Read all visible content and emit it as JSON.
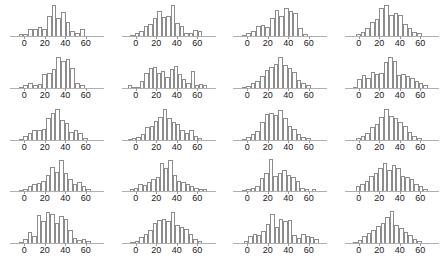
{
  "figure": {
    "title": "",
    "layout": {
      "rows": 5,
      "columns": 4,
      "panel_count": 20
    },
    "colors": {
      "background": "#ffffff",
      "bar_outline": "#8c8c8c",
      "bar_fill": "#ffffff",
      "axis_line": "#b0b0b0",
      "tick_label": "#1a1a1a"
    }
  },
  "axis": {
    "tick_labels": [
      "0",
      "20",
      "40",
      "60"
    ],
    "tick_values": [
      0,
      20,
      40,
      60
    ],
    "xlim": [
      -8,
      72
    ],
    "ylabel": "",
    "xlabel": ""
  },
  "chart_data": {
    "type": "bar",
    "title": "",
    "subtitle": "",
    "xlabel": "",
    "ylabel": "",
    "grid": false,
    "legend": "none",
    "layout": {
      "rows": 5,
      "columns": 4,
      "shared_x_axis": true
    },
    "xlim": [
      -8,
      72
    ],
    "ylim": [
      0,
      1
    ],
    "bin_width": 4,
    "bin_centers": [
      -6,
      -2,
      2,
      6,
      10,
      14,
      18,
      22,
      26,
      30,
      34,
      38,
      42,
      46,
      50,
      54,
      58,
      62,
      66,
      70
    ],
    "xtick_values": [
      0,
      20,
      40,
      60
    ],
    "xtick_labels": [
      "0",
      "20",
      "40",
      "60"
    ],
    "note": "Grid of 20 small-multiple histograms; values are relative bin counts (0-1 scale of panel height).",
    "panels": [
      {
        "index": 1,
        "row": 1,
        "col": 1,
        "categories": [
          -6,
          -2,
          2,
          6,
          10,
          14,
          18,
          22,
          26,
          30,
          34,
          38,
          42,
          46,
          50,
          54,
          58,
          62,
          66,
          70
        ],
        "values": [
          0,
          0.05,
          0.05,
          0.22,
          0.22,
          0.28,
          0.22,
          0.62,
          0.97,
          0.56,
          0.75,
          0.45,
          0.16,
          0.09,
          0.22,
          0,
          0,
          0,
          0,
          0
        ]
      },
      {
        "index": 2,
        "row": 1,
        "col": 2,
        "categories": [
          -6,
          -2,
          2,
          6,
          10,
          14,
          18,
          22,
          26,
          30,
          34,
          38,
          42,
          46,
          50,
          54,
          58,
          62,
          66,
          70
        ],
        "values": [
          0,
          0.03,
          0.09,
          0.16,
          0.31,
          0.38,
          0.56,
          0.78,
          0.59,
          0.62,
          0.97,
          0.41,
          0.31,
          0.09,
          0.09,
          0.19,
          0.16,
          0,
          0,
          0
        ]
      },
      {
        "index": 3,
        "row": 1,
        "col": 3,
        "categories": [
          -6,
          -2,
          2,
          6,
          10,
          14,
          18,
          22,
          26,
          30,
          34,
          38,
          42,
          46,
          50,
          54,
          58,
          62,
          66,
          70
        ],
        "values": [
          0,
          0.03,
          0.09,
          0.16,
          0.31,
          0.34,
          0.28,
          0.56,
          0.81,
          0.62,
          0.88,
          0.78,
          0.72,
          0.25,
          0.06,
          0,
          0,
          0,
          0,
          0
        ]
      },
      {
        "index": 4,
        "row": 1,
        "col": 4,
        "categories": [
          -6,
          -2,
          2,
          6,
          10,
          14,
          18,
          22,
          26,
          30,
          34,
          38,
          42,
          46,
          50,
          54,
          58,
          62,
          66,
          70
        ],
        "values": [
          0,
          0,
          0.06,
          0.12,
          0.25,
          0.44,
          0.53,
          0.88,
          0.97,
          0.66,
          0.72,
          0.66,
          0.38,
          0.25,
          0.12,
          0.09,
          0,
          0,
          0,
          0
        ]
      },
      {
        "index": 5,
        "row": 2,
        "col": 1,
        "categories": [
          -6,
          -2,
          2,
          6,
          10,
          14,
          18,
          22,
          26,
          30,
          34,
          38,
          42,
          46,
          50,
          54,
          58,
          62,
          66,
          70
        ],
        "values": [
          0,
          0.03,
          0.09,
          0.16,
          0.09,
          0.12,
          0.44,
          0.47,
          0.59,
          0.97,
          0.84,
          0.91,
          0.62,
          0.16,
          0.09,
          0,
          0,
          0,
          0,
          0
        ]
      },
      {
        "index": 6,
        "row": 2,
        "col": 2,
        "categories": [
          -6,
          -2,
          2,
          6,
          10,
          14,
          18,
          22,
          26,
          30,
          34,
          38,
          42,
          46,
          50,
          54,
          58,
          62,
          66,
          70
        ],
        "values": [
          0.09,
          0.03,
          0.03,
          0.22,
          0.47,
          0.62,
          0.66,
          0.47,
          0.53,
          0.34,
          0.59,
          0.69,
          0.44,
          0.28,
          0.16,
          0.53,
          0.09,
          0.12,
          0.09,
          0
        ]
      },
      {
        "index": 7,
        "row": 2,
        "col": 3,
        "categories": [
          -6,
          -2,
          2,
          6,
          10,
          14,
          18,
          22,
          26,
          30,
          34,
          38,
          42,
          46,
          50,
          54,
          58,
          62,
          66,
          70
        ],
        "values": [
          0,
          0.03,
          0.06,
          0.16,
          0.22,
          0.38,
          0.56,
          0.66,
          0.75,
          0.97,
          0.72,
          0.62,
          0.5,
          0.25,
          0.16,
          0.09,
          0,
          0,
          0,
          0
        ]
      },
      {
        "index": 8,
        "row": 2,
        "col": 4,
        "categories": [
          -6,
          -2,
          2,
          6,
          10,
          14,
          18,
          22,
          26,
          30,
          34,
          38,
          42,
          46,
          50,
          54,
          58,
          62,
          66,
          70
        ],
        "values": [
          0,
          0.03,
          0.28,
          0.41,
          0.31,
          0.5,
          0.44,
          0.47,
          0.81,
          0.97,
          0.84,
          0.41,
          0.44,
          0.38,
          0.31,
          0.22,
          0.16,
          0.09,
          0,
          0
        ]
      },
      {
        "index": 9,
        "row": 3,
        "col": 1,
        "categories": [
          -6,
          -2,
          2,
          6,
          10,
          14,
          18,
          22,
          26,
          30,
          34,
          38,
          42,
          46,
          50,
          54,
          58,
          62,
          66,
          70
        ],
        "values": [
          0,
          0.03,
          0.12,
          0.22,
          0.31,
          0.31,
          0.34,
          0.69,
          0.84,
          0.97,
          0.62,
          0.53,
          0.25,
          0.31,
          0.22,
          0.06,
          0,
          0,
          0,
          0
        ]
      },
      {
        "index": 10,
        "row": 3,
        "col": 2,
        "categories": [
          -6,
          -2,
          2,
          6,
          10,
          14,
          18,
          22,
          26,
          30,
          34,
          38,
          42,
          46,
          50,
          54,
          58,
          62,
          66,
          70
        ],
        "values": [
          0.03,
          0.06,
          0.09,
          0.16,
          0.38,
          0.44,
          0.59,
          0.72,
          0.97,
          0.66,
          0.56,
          0.5,
          0.31,
          0.22,
          0.31,
          0.12,
          0.06,
          0,
          0,
          0
        ]
      },
      {
        "index": 11,
        "row": 3,
        "col": 3,
        "categories": [
          -6,
          -2,
          2,
          6,
          10,
          14,
          18,
          22,
          26,
          30,
          34,
          38,
          42,
          46,
          50,
          54,
          58,
          62,
          66,
          70
        ],
        "values": [
          0,
          0.03,
          0.09,
          0.16,
          0.28,
          0.56,
          0.81,
          0.84,
          0.78,
          0.91,
          0.69,
          0.41,
          0.34,
          0.16,
          0.09,
          0.06,
          0,
          0,
          0,
          0
        ]
      },
      {
        "index": 12,
        "row": 3,
        "col": 4,
        "categories": [
          -6,
          -2,
          2,
          6,
          10,
          14,
          18,
          22,
          26,
          30,
          34,
          38,
          42,
          46,
          50,
          54,
          58,
          62,
          66,
          70
        ],
        "values": [
          0,
          0,
          0.06,
          0.12,
          0.22,
          0.38,
          0.5,
          0.72,
          0.97,
          0.75,
          0.69,
          0.56,
          0.44,
          0.25,
          0.12,
          0.06,
          0,
          0,
          0,
          0
        ]
      },
      {
        "index": 13,
        "row": 4,
        "col": 1,
        "categories": [
          -6,
          -2,
          2,
          6,
          10,
          14,
          18,
          22,
          26,
          30,
          34,
          38,
          42,
          46,
          50,
          54,
          58,
          62,
          66,
          70
        ],
        "values": [
          0,
          0.03,
          0.09,
          0.16,
          0.22,
          0.25,
          0.31,
          0.5,
          0.75,
          0.62,
          0.97,
          0.56,
          0.38,
          0.22,
          0.28,
          0.16,
          0.09,
          0,
          0,
          0
        ]
      },
      {
        "index": 14,
        "row": 4,
        "col": 2,
        "categories": [
          -6,
          -2,
          2,
          6,
          10,
          14,
          18,
          22,
          26,
          30,
          34,
          38,
          42,
          46,
          50,
          54,
          58,
          62,
          66,
          70
        ],
        "values": [
          0,
          0.06,
          0.12,
          0.22,
          0.19,
          0.28,
          0.38,
          0.44,
          0.88,
          0.72,
          0.97,
          0.5,
          0.31,
          0.28,
          0.22,
          0.16,
          0.12,
          0.06,
          0.09,
          0
        ]
      },
      {
        "index": 15,
        "row": 4,
        "col": 3,
        "categories": [
          -6,
          -2,
          2,
          6,
          10,
          14,
          18,
          22,
          26,
          30,
          34,
          38,
          42,
          46,
          50,
          54,
          58,
          62,
          66,
          70
        ],
        "values": [
          0,
          0.03,
          0.06,
          0.12,
          0.16,
          0.41,
          0.56,
          1.0,
          0.47,
          0.59,
          0.66,
          0.5,
          0.44,
          0.31,
          0.12,
          0.06,
          0,
          0.09,
          0,
          0
        ]
      },
      {
        "index": 16,
        "row": 4,
        "col": 4,
        "categories": [
          -6,
          -2,
          2,
          6,
          10,
          14,
          18,
          22,
          26,
          30,
          34,
          38,
          42,
          46,
          50,
          54,
          58,
          62,
          66,
          70
        ],
        "values": [
          0,
          0,
          0.16,
          0.22,
          0.31,
          0.47,
          0.59,
          0.72,
          0.88,
          0.66,
          0.84,
          0.72,
          0.47,
          0.44,
          0.38,
          0.22,
          0.16,
          0.09,
          0,
          0
        ]
      },
      {
        "index": 17,
        "row": 5,
        "col": 1,
        "categories": [
          -6,
          -2,
          2,
          6,
          10,
          14,
          18,
          22,
          26,
          30,
          34,
          38,
          42,
          46,
          50,
          54,
          58,
          62,
          66,
          70
        ],
        "values": [
          0,
          0.03,
          0.12,
          0.34,
          0.22,
          0.88,
          0.69,
          0.97,
          0.91,
          0.62,
          0.84,
          0.75,
          0.41,
          0.16,
          0.09,
          0.12,
          0.06,
          0,
          0,
          0
        ]
      },
      {
        "index": 18,
        "row": 5,
        "col": 2,
        "categories": [
          -6,
          -2,
          2,
          6,
          10,
          14,
          18,
          22,
          26,
          30,
          34,
          38,
          42,
          46,
          50,
          54,
          58,
          62,
          66,
          70
        ],
        "values": [
          0,
          0.03,
          0.06,
          0.19,
          0.28,
          0.41,
          0.62,
          0.72,
          0.75,
          0.69,
          0.97,
          0.56,
          0.5,
          0.44,
          0.28,
          0.12,
          0.06,
          0,
          0,
          0
        ]
      },
      {
        "index": 19,
        "row": 5,
        "col": 3,
        "categories": [
          -6,
          -2,
          2,
          6,
          10,
          14,
          18,
          22,
          26,
          30,
          34,
          38,
          42,
          46,
          50,
          54,
          58,
          62,
          66,
          70
        ],
        "values": [
          0,
          0,
          0.06,
          0.22,
          0.28,
          0.25,
          0.38,
          0.59,
          0.91,
          0.5,
          0.75,
          0.69,
          0.72,
          0.25,
          0.16,
          0.28,
          0.22,
          0.19,
          0.12,
          0
        ]
      },
      {
        "index": 20,
        "row": 5,
        "col": 4,
        "categories": [
          -6,
          -2,
          2,
          6,
          10,
          14,
          18,
          22,
          26,
          30,
          34,
          38,
          42,
          46,
          50,
          54,
          58,
          62,
          66,
          70
        ],
        "values": [
          0,
          0.03,
          0.09,
          0.22,
          0.31,
          0.41,
          0.53,
          0.62,
          0.81,
          1.0,
          0.56,
          0.47,
          0.34,
          0.25,
          0.12,
          0.06,
          0,
          0,
          0,
          0
        ]
      }
    ]
  }
}
